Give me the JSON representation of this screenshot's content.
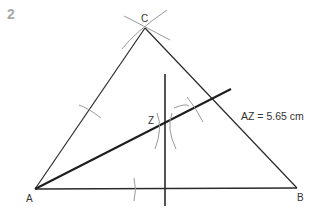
{
  "question_number": "2",
  "points": {
    "A": {
      "label": "A",
      "x": 35,
      "y": 189
    },
    "B": {
      "label": "B",
      "x": 297,
      "y": 188
    },
    "C": {
      "label": "C",
      "x": 145,
      "y": 28
    },
    "Z": {
      "label": "Z",
      "x": 165,
      "y": 123
    }
  },
  "measurement": "AZ = 5.65 cm",
  "colors": {
    "line": "#2a2a2a",
    "arc": "#999999",
    "label": "#333333",
    "number": "#a8a8a8"
  }
}
